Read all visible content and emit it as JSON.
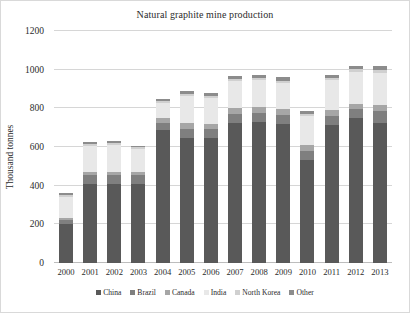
{
  "chart_data": {
    "type": "bar",
    "stacked": true,
    "title": "Natural graphite mine production",
    "xlabel": "",
    "ylabel": "Thousand tonnes",
    "ylim": [
      0,
      1200
    ],
    "ytick_step": 200,
    "yticks": [
      "1200",
      "1000",
      "800",
      "600",
      "400",
      "200",
      "0"
    ],
    "grid": true,
    "legend_position": "bottom",
    "categories": [
      "2000",
      "2001",
      "2002",
      "2003",
      "2004",
      "2005",
      "2006",
      "2007",
      "2008",
      "2009",
      "2010",
      "2011",
      "2012",
      "2013"
    ],
    "series": [
      {
        "name": "China",
        "color": "#595959",
        "values": [
          200,
          410,
          410,
          410,
          690,
          645,
          645,
          725,
          730,
          720,
          535,
          715,
          750,
          725
        ]
      },
      {
        "name": "Brazil",
        "color": "#7f7f7f",
        "values": [
          20,
          45,
          45,
          45,
          35,
          50,
          50,
          45,
          45,
          45,
          45,
          45,
          45,
          60
        ]
      },
      {
        "name": "Canada",
        "color": "#a6a6a6",
        "values": [
          15,
          15,
          15,
          15,
          25,
          30,
          25,
          30,
          30,
          30,
          30,
          30,
          30,
          30
        ]
      },
      {
        "name": "India",
        "color": "#e8e8e8",
        "values": [
          105,
          135,
          140,
          120,
          80,
          140,
          135,
          140,
          140,
          135,
          150,
          155,
          165,
          170
        ]
      },
      {
        "name": "North Korea",
        "color": "#d0d0d0",
        "values": [
          10,
          10,
          10,
          10,
          10,
          10,
          10,
          10,
          10,
          10,
          10,
          10,
          15,
          15
        ]
      },
      {
        "name": "Other",
        "color": "#8c8c8c",
        "values": [
          10,
          10,
          10,
          5,
          10,
          15,
          15,
          15,
          20,
          20,
          15,
          20,
          15,
          20
        ]
      }
    ],
    "totals": [
      360,
      625,
      630,
      605,
      850,
      890,
      880,
      965,
      975,
      960,
      785,
      975,
      1020,
      1020
    ]
  },
  "legend": {
    "items": [
      {
        "label": "China"
      },
      {
        "label": "Brazil"
      },
      {
        "label": "Canada"
      },
      {
        "label": "India"
      },
      {
        "label": "North Korea"
      },
      {
        "label": "Other"
      }
    ]
  }
}
